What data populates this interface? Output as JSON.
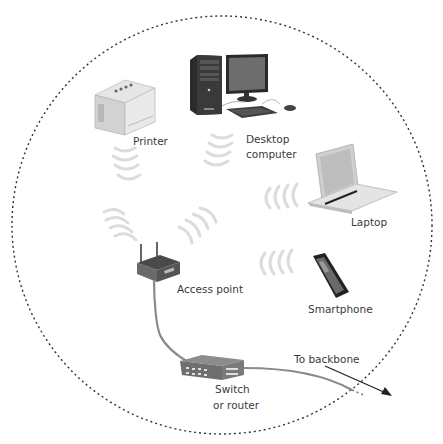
{
  "diagram": {
    "type": "wireless-network",
    "boundary": "dashed-circle",
    "nodes": [
      {
        "id": "printer",
        "label": "Printer",
        "connection": "wireless"
      },
      {
        "id": "desktop",
        "label_line1": "Desktop",
        "label_line2": "computer",
        "connection": "wireless"
      },
      {
        "id": "laptop",
        "label": "Laptop",
        "connection": "wireless"
      },
      {
        "id": "smartphone",
        "label": "Smartphone",
        "connection": "wireless"
      },
      {
        "id": "access_point",
        "label": "Access point",
        "connection": "wired"
      },
      {
        "id": "switch",
        "label_line1": "Switch",
        "label_line2": "or router",
        "connection": "wired"
      }
    ],
    "edges": [
      {
        "from": "printer",
        "to": "access_point",
        "type": "wireless"
      },
      {
        "from": "desktop",
        "to": "access_point",
        "type": "wireless"
      },
      {
        "from": "laptop",
        "to": "access_point",
        "type": "wireless"
      },
      {
        "from": "smartphone",
        "to": "access_point",
        "type": "wireless"
      },
      {
        "from": "access_point",
        "to": "switch",
        "type": "cable"
      },
      {
        "from": "switch",
        "to": "backbone",
        "type": "cable"
      }
    ],
    "backbone_label": "To backbone"
  },
  "labels": {
    "printer": "Printer",
    "desktop_1": "Desktop",
    "desktop_2": "computer",
    "laptop": "Laptop",
    "smartphone": "Smartphone",
    "access_point": "Access point",
    "switch_1": "Switch",
    "switch_2": "or router",
    "backbone": "To backbone"
  },
  "colors": {
    "boundary": "#333333",
    "wave": "#dcdcdc",
    "cable": "#8a8a8a",
    "text": "#3a3a3a"
  }
}
